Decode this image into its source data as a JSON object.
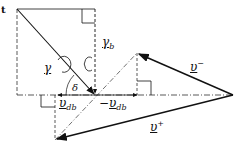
{
  "diagram": {
    "labels": {
      "corner_mark": "t",
      "gamma": "γ",
      "gamma_b": "γ",
      "gamma_b_sub": "b",
      "delta": "δ",
      "v_db": "υ",
      "v_db_sub": "db",
      "neg_v_db_sign": "−",
      "neg_v_db": "υ",
      "neg_v_db_sub": "db",
      "v_minus": "υ",
      "v_minus_sup": "−",
      "v_plus": "υ",
      "v_plus_sup": "+"
    },
    "colors": {
      "line": "#111111",
      "background": "#ffffff"
    }
  }
}
